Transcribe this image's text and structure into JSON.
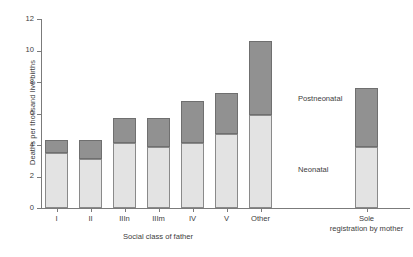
{
  "chart_data": {
    "type": "bar",
    "subtype": "stacked",
    "title": "",
    "xlabel": "Social class of father",
    "ylabel": "Deaths per thousand live births",
    "ylim": [
      0,
      12
    ],
    "yticks": [
      0,
      2,
      4,
      6,
      8,
      10,
      12
    ],
    "ytick_labels": [
      "0",
      "2",
      "4",
      "6",
      "8",
      "10",
      "12"
    ],
    "grid": false,
    "legend_position": "inside-right",
    "categories": [
      "I",
      "II",
      "IIIn",
      "IIIm",
      "IV",
      "V",
      "Other",
      "Sole registration by mother"
    ],
    "series": [
      {
        "name": "Neonatal",
        "color": "#e3e3e3",
        "values": [
          3.5,
          3.1,
          4.1,
          3.9,
          4.1,
          4.7,
          5.9,
          3.9
        ]
      },
      {
        "name": "Postneonatal",
        "color": "#919191",
        "values": [
          0.8,
          1.2,
          1.6,
          1.8,
          2.7,
          2.6,
          4.7,
          3.7
        ]
      }
    ],
    "totals": [
      4.3,
      4.3,
      5.7,
      5.7,
      6.8,
      7.3,
      10.6,
      7.6
    ],
    "annotations": [
      {
        "text": "Postneonatal",
        "series": "Postneonatal"
      },
      {
        "text": "Neonatal",
        "series": "Neonatal"
      }
    ]
  },
  "axis": {
    "y_title": "Deaths per thousand live births",
    "x_title": "Social class of father",
    "y_ticks": [
      "0",
      "2",
      "4",
      "6",
      "8",
      "10",
      "12"
    ]
  },
  "bars": [
    {
      "label": "I",
      "label_lines": [
        "I"
      ],
      "neonatal": 3.5,
      "postneonatal": 0.8,
      "total": 4.3,
      "group": "social-class"
    },
    {
      "label": "II",
      "label_lines": [
        "II"
      ],
      "neonatal": 3.1,
      "postneonatal": 1.2,
      "total": 4.3,
      "group": "social-class"
    },
    {
      "label": "IIIn",
      "label_lines": [
        "IIIn"
      ],
      "neonatal": 4.1,
      "postneonatal": 1.6,
      "total": 5.7,
      "group": "social-class"
    },
    {
      "label": "IIIm",
      "label_lines": [
        "IIIm"
      ],
      "neonatal": 3.9,
      "postneonatal": 1.8,
      "total": 5.7,
      "group": "social-class"
    },
    {
      "label": "IV",
      "label_lines": [
        "IV"
      ],
      "neonatal": 4.1,
      "postneonatal": 2.7,
      "total": 6.8,
      "group": "social-class"
    },
    {
      "label": "V",
      "label_lines": [
        "V"
      ],
      "neonatal": 4.7,
      "postneonatal": 2.6,
      "total": 7.3,
      "group": "social-class"
    },
    {
      "label": "Other",
      "label_lines": [
        "Other"
      ],
      "neonatal": 5.9,
      "postneonatal": 4.7,
      "total": 10.6,
      "group": "social-class"
    },
    {
      "label": "Sole registration by mother",
      "label_lines": [
        "Sole",
        "registration by mother"
      ],
      "neonatal": 3.9,
      "postneonatal": 3.7,
      "total": 7.6,
      "group": "sole-registration"
    }
  ],
  "legend": {
    "postneonatal_label": "Postneonatal",
    "neonatal_label": "Neonatal"
  },
  "colors": {
    "neonatal": "#e3e3e3",
    "postneonatal": "#919191",
    "axis": "#7b7b7b",
    "text": "#3d3d3d",
    "background": "#ffffff"
  }
}
